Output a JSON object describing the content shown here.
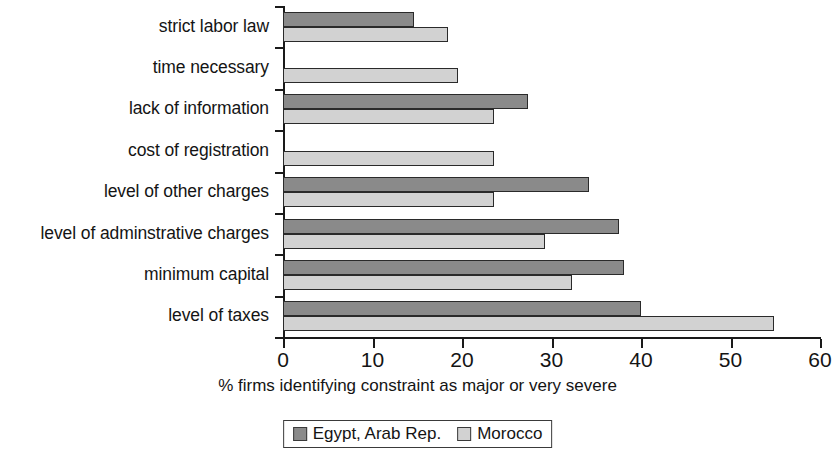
{
  "chart_data": {
    "type": "bar",
    "orientation": "horizontal",
    "title": "",
    "xlabel": "% firms identifying constraint as major or very severe",
    "ylabel": "",
    "xlim": [
      0,
      60
    ],
    "xticks": [
      0,
      10,
      20,
      30,
      40,
      50,
      60
    ],
    "xtick_labels": [
      "0",
      "10",
      "20",
      "30",
      "40",
      "50",
      "60"
    ],
    "grid": false,
    "legend_position": "bottom-center",
    "categories": [
      "strict labor law",
      "time necessary",
      "lack of information",
      "cost of registration",
      "level of other charges",
      "level of adminstrative charges",
      "minimum capital",
      "level of taxes"
    ],
    "series": [
      {
        "name": "Egypt, Arab Rep.",
        "color": "#8a8a8a",
        "values": [
          14.6,
          null,
          27.4,
          null,
          34.2,
          37.5,
          38.1,
          40.0
        ]
      },
      {
        "name": "Morocco",
        "color": "#d2d2d2",
        "values": [
          18.4,
          19.6,
          23.6,
          23.6,
          23.6,
          29.3,
          32.3,
          54.9
        ]
      }
    ]
  },
  "legend": {
    "entries": [
      {
        "label": "Egypt, Arab Rep."
      },
      {
        "label": "Morocco"
      }
    ]
  }
}
